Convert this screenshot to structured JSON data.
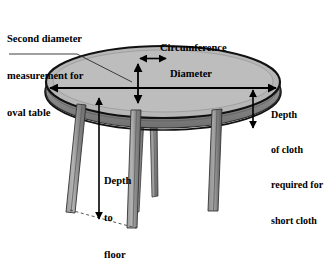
{
  "diagram": {
    "background_color": "#ffffff",
    "ink_color": "#000000",
    "table_top_color": "#b5b5b5",
    "table_edge_color": "#8a8a8a",
    "leg_light_color": "#a8a8a8",
    "leg_dark_color": "#6f6f6f"
  },
  "labels": {
    "second_diameter": {
      "line1": "Second diameter",
      "line2": "measurement for",
      "line3": "oval table"
    },
    "circumference": "Circumference",
    "diameter": "Diameter",
    "depth_of_cloth": {
      "line1": "Depth",
      "line2": "of cloth",
      "line3": "required for",
      "line4": "short cloth"
    },
    "depth_to_floor": {
      "line1": "Depth",
      "line2": "to",
      "line3": "floor"
    }
  },
  "measurements": [
    {
      "name": "circumference",
      "arrow": "double-horizontal",
      "position": "back-rim-of-tabletop"
    },
    {
      "name": "diameter",
      "arrow": "double-horizontal",
      "position": "across-tabletop-width"
    },
    {
      "name": "second-diameter",
      "arrow": "double-vertical",
      "position": "across-tabletop-depth"
    },
    {
      "name": "depth-of-cloth",
      "arrow": "double-vertical",
      "position": "right-of-table-edge"
    },
    {
      "name": "depth-to-floor",
      "arrow": "double-vertical",
      "position": "tabletop-to-floor"
    }
  ],
  "parts": [
    {
      "name": "tabletop-ellipse",
      "shape": "ellipse"
    },
    {
      "name": "circumference-outline-ellipse",
      "shape": "ellipse"
    },
    {
      "name": "table-edge-band",
      "shape": "band"
    },
    {
      "name": "leg-front-left",
      "shape": "tapered-leg"
    },
    {
      "name": "leg-back-left",
      "shape": "tapered-leg"
    },
    {
      "name": "leg-back-center",
      "shape": "tapered-leg"
    },
    {
      "name": "leg-front-right",
      "shape": "tapered-leg"
    },
    {
      "name": "floor-line",
      "shape": "dashed-line"
    },
    {
      "name": "leader-line",
      "shape": "polyline"
    }
  ]
}
